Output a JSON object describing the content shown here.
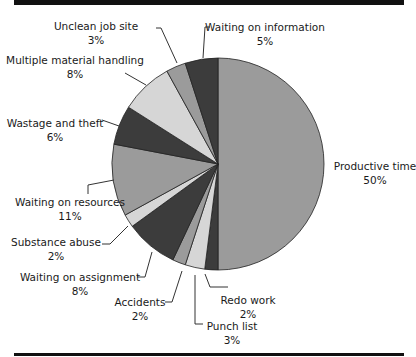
{
  "chart_data": {
    "type": "pie",
    "title": "",
    "start": "12 o'clock",
    "direction": "clockwise",
    "slices": [
      {
        "label": "Productive time",
        "value": 50,
        "pct_label": "50%",
        "color": "#9b9b9b"
      },
      {
        "label": "Redo work",
        "value": 2,
        "pct_label": "2%",
        "color": "#3c3c3c"
      },
      {
        "label": "Punch list",
        "value": 3,
        "pct_label": "3%",
        "color": "#d6d6d6"
      },
      {
        "label": "Accidents",
        "value": 2,
        "pct_label": "2%",
        "color": "#9b9b9b"
      },
      {
        "label": "Waiting on assignment",
        "value": 8,
        "pct_label": "8%",
        "color": "#3c3c3c"
      },
      {
        "label": "Substance abuse",
        "value": 2,
        "pct_label": "2%",
        "color": "#d6d6d6"
      },
      {
        "label": "Waiting on resources",
        "value": 11,
        "pct_label": "11%",
        "color": "#9b9b9b"
      },
      {
        "label": "Wastage and theft",
        "value": 6,
        "pct_label": "6%",
        "color": "#3c3c3c"
      },
      {
        "label": "Multiple material handling",
        "value": 8,
        "pct_label": "8%",
        "color": "#d6d6d6"
      },
      {
        "label": "Unclean job site",
        "value": 3,
        "pct_label": "3%",
        "color": "#9b9b9b"
      },
      {
        "label": "Waiting on information",
        "value": 5,
        "pct_label": "5%",
        "color": "#3c3c3c"
      }
    ],
    "legend": "none (direct labels with leader lines)"
  }
}
